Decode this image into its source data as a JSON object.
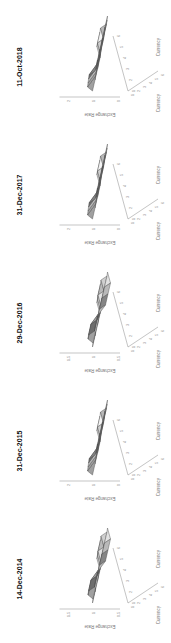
{
  "chart_data": [
    {
      "type": "surface3d",
      "title": "14-Dec-2014",
      "xlabel": "Currency",
      "ylabel": "Currency",
      "zlabel": "Exchange Rate",
      "zticks": [
        "0.5",
        "1",
        "1.5"
      ],
      "xticks": [
        "1",
        "2",
        "3",
        "4",
        "5",
        "6"
      ],
      "yticks": [
        "1",
        "2",
        "3",
        "4",
        "5",
        "6"
      ],
      "z": [
        [
          1.0,
          1.1,
          1.3,
          1.4,
          1.4,
          1.5
        ],
        [
          0.9,
          1.0,
          1.2,
          1.3,
          1.3,
          1.4
        ],
        [
          0.8,
          0.9,
          1.0,
          1.1,
          1.2,
          1.2
        ],
        [
          0.7,
          0.8,
          0.9,
          1.0,
          1.1,
          1.1
        ],
        [
          0.7,
          0.8,
          0.9,
          0.9,
          1.0,
          1.0
        ],
        [
          0.6,
          0.7,
          0.8,
          0.9,
          0.9,
          1.0
        ]
      ]
    },
    {
      "type": "surface3d",
      "title": "31-Dec-2015",
      "xlabel": "Currency",
      "ylabel": "Currency",
      "zlabel": "Exchange Rate",
      "zticks": [
        "0",
        "1",
        "2"
      ],
      "xticks": [
        "1",
        "2",
        "3",
        "4",
        "5",
        "6"
      ],
      "yticks": [
        "1",
        "2",
        "3",
        "4",
        "5",
        "6"
      ],
      "z": [
        [
          1.0,
          1.2,
          1.3,
          1.4,
          1.5,
          1.5
        ],
        [
          0.9,
          1.0,
          1.1,
          1.2,
          1.3,
          1.4
        ],
        [
          0.8,
          0.9,
          1.0,
          1.1,
          1.2,
          1.3
        ],
        [
          0.7,
          0.8,
          0.9,
          1.0,
          1.1,
          1.2
        ],
        [
          0.7,
          0.8,
          0.8,
          0.9,
          1.0,
          1.1
        ],
        [
          0.6,
          0.7,
          0.8,
          0.8,
          0.9,
          1.0
        ]
      ]
    },
    {
      "type": "surface3d",
      "title": "29-Dec-2016",
      "xlabel": "Currency",
      "ylabel": "Currency",
      "zlabel": "Exchange Rate",
      "zticks": [
        "0.5",
        "1",
        "1.5"
      ],
      "xticks": [
        "1",
        "2",
        "3",
        "4",
        "5",
        "6"
      ],
      "yticks": [
        "1",
        "2",
        "3",
        "4",
        "5",
        "6"
      ],
      "z": [
        [
          1.0,
          1.1,
          1.3,
          1.4,
          1.4,
          1.5
        ],
        [
          0.9,
          1.0,
          1.2,
          1.3,
          1.3,
          1.4
        ],
        [
          0.8,
          0.9,
          1.0,
          1.1,
          1.2,
          1.2
        ],
        [
          0.7,
          0.8,
          0.9,
          1.0,
          1.1,
          1.1
        ],
        [
          0.7,
          0.8,
          0.9,
          0.9,
          1.0,
          1.0
        ],
        [
          0.6,
          0.7,
          0.8,
          0.9,
          0.9,
          1.0
        ]
      ]
    },
    {
      "type": "surface3d",
      "title": "31-Dec-2017",
      "xlabel": "Currency",
      "ylabel": "Currency",
      "zlabel": "Exchange Rate",
      "zticks": [
        "0",
        "1",
        "2"
      ],
      "xticks": [
        "1",
        "2",
        "3",
        "4",
        "5",
        "6"
      ],
      "yticks": [
        "1",
        "2",
        "3",
        "4",
        "5",
        "6"
      ],
      "z": [
        [
          1.0,
          1.2,
          1.3,
          1.4,
          1.5,
          1.5
        ],
        [
          0.9,
          1.0,
          1.1,
          1.2,
          1.3,
          1.4
        ],
        [
          0.8,
          0.9,
          1.0,
          1.1,
          1.2,
          1.3
        ],
        [
          0.7,
          0.8,
          0.9,
          1.0,
          1.1,
          1.2
        ],
        [
          0.7,
          0.8,
          0.8,
          0.9,
          1.0,
          1.1
        ],
        [
          0.6,
          0.7,
          0.8,
          0.8,
          0.9,
          1.0
        ]
      ]
    },
    {
      "type": "surface3d",
      "title": "11-Oct-2018",
      "xlabel": "Currency",
      "ylabel": "Currency",
      "zlabel": "Exchange Rate",
      "zticks": [
        "0",
        "1",
        "2"
      ],
      "xticks": [
        "1",
        "2",
        "3",
        "4",
        "5",
        "6"
      ],
      "yticks": [
        "1",
        "2",
        "3",
        "4",
        "5",
        "6"
      ],
      "z": [
        [
          1.0,
          1.2,
          1.3,
          1.4,
          1.5,
          1.5
        ],
        [
          0.9,
          1.0,
          1.1,
          1.2,
          1.3,
          1.4
        ],
        [
          0.8,
          0.9,
          1.0,
          1.1,
          1.2,
          1.3
        ],
        [
          0.7,
          0.8,
          0.9,
          1.0,
          1.1,
          1.2
        ],
        [
          0.7,
          0.8,
          0.8,
          0.9,
          1.0,
          1.1
        ],
        [
          0.6,
          0.7,
          0.8,
          0.8,
          0.9,
          1.0
        ]
      ]
    }
  ]
}
